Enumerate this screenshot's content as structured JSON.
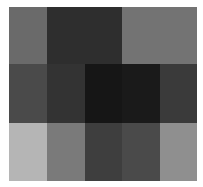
{
  "chart_data": {
    "type": "heatmap",
    "title": "",
    "xlabel": "",
    "ylabel": "",
    "rows": 3,
    "cols": 5,
    "colormap": "grayscale",
    "values": [
      [
        106,
        46,
        46,
        115,
        115
      ],
      [
        74,
        51,
        22,
        26,
        58
      ],
      [
        181,
        122,
        62,
        74,
        143
      ]
    ],
    "colors": [
      [
        "#6a6a6a",
        "#2e2e2e",
        "#2e2e2e",
        "#737373",
        "#737373"
      ],
      [
        "#4a4a4a",
        "#333333",
        "#161616",
        "#1a1a1a",
        "#3a3a3a"
      ],
      [
        "#b5b5b5",
        "#7a7a7a",
        "#3e3e3e",
        "#4a4a4a",
        "#8f8f8f"
      ]
    ]
  }
}
